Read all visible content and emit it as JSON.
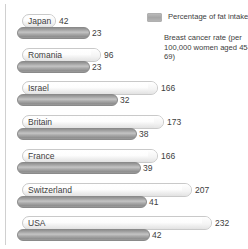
{
  "chart_data": {
    "type": "bar",
    "title": "",
    "orientation": "horizontal",
    "categories": [
      "Japan",
      "Romania",
      "Israel",
      "Britain",
      "France",
      "Switzerland",
      "USA"
    ],
    "series": [
      {
        "name": "Percentage of fat intake",
        "key": "fat",
        "values": [
          23,
          23,
          32,
          38,
          39,
          41,
          42
        ],
        "color": "#a0a0a0",
        "max": 42
      },
      {
        "name": "Breast cancer rate (per 100,000 women aged 45-69)",
        "key": "rate",
        "values": [
          42,
          96,
          166,
          173,
          166,
          207,
          232
        ],
        "color": "#f0f0f0",
        "max": 232
      }
    ],
    "xlabel": "",
    "ylabel": "",
    "grid": false,
    "legend_position": "top-right"
  },
  "legend": {
    "fat_label": "Percentage of fat intake",
    "rate_label": "Breast cancer rate (per 100,000 women aged 45–69)",
    "swatch_color": "#a6a6a6"
  },
  "rows": [
    {
      "country": "Japan",
      "rate": "42",
      "fat": "23"
    },
    {
      "country": "Romania",
      "rate": "96",
      "fat": "23"
    },
    {
      "country": "Israel",
      "rate": "166",
      "fat": "32"
    },
    {
      "country": "Britain",
      "rate": "173",
      "fat": "38"
    },
    {
      "country": "France",
      "rate": "166",
      "fat": "39"
    },
    {
      "country": "Switzerland",
      "rate": "207",
      "fat": "41"
    },
    {
      "country": "USA",
      "rate": "232",
      "fat": "42"
    }
  ]
}
